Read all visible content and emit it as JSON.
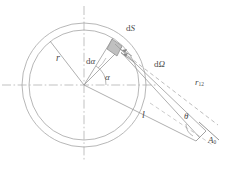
{
  "figure": {
    "type": "geometry-diagram",
    "title": "",
    "background_color": "#ffffff",
    "line_color": "#9a9a9a",
    "dark_line_color": "#7d7d7d",
    "label_color": "#4a4a4a",
    "shade_color": "#b8b8b8",
    "width": 239,
    "height": 170
  },
  "labels": {
    "radius": "r",
    "differential_angle_d": "d",
    "differential_angle_sym": "α",
    "angle_alpha": "α",
    "surface_element_d": "d",
    "surface_element_sym": "S",
    "solid_angle_d": "d",
    "solid_angle_sym": "Ω",
    "distance_r12_base": "r",
    "distance_r12_sub": "12",
    "length_l": "l",
    "angle_theta": "θ",
    "receiver_base": "A",
    "receiver_sub": "0"
  },
  "geometry": {
    "center": {
      "x": 84,
      "y": 85
    },
    "outer_circle_radius": 62,
    "inner_circle_radius": 55,
    "horizontal_axis": {
      "x1": 2,
      "y1": 85,
      "x2": 158,
      "y2": 85
    },
    "vertical_axis": {
      "x1": 84,
      "y1": 6,
      "x2": 84,
      "y2": 160
    },
    "radius_line_angle_deg": 128,
    "dalpha_line_angle_deg": 72,
    "alpha_arc_radius": 22,
    "surface_element_point": {
      "x": 122,
      "y": 47
    },
    "receiver_point": {
      "x": 209,
      "y": 133
    },
    "solid_angle_label_point": {
      "x": 159,
      "y": 63
    },
    "theta_arc_radius": 14
  },
  "annotations": {
    "description": "Radiation exchange geometry: concentric circles of radius r with centre O, differential surface element dS on the circle, solid angle dΩ subtended toward receiving surface A0 at distance r12, with ray length l and incidence angle θ."
  }
}
